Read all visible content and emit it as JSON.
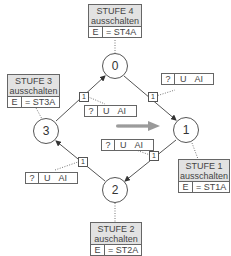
{
  "states": [
    {
      "id": "0",
      "label": "0"
    },
    {
      "id": "1",
      "label": "1"
    },
    {
      "id": "2",
      "label": "2"
    },
    {
      "id": "3",
      "label": "3"
    }
  ],
  "actions": {
    "stufe4": {
      "title": "STUFE 4",
      "subtitle": "ausschalten",
      "e": "E",
      "value": "= ST4A"
    },
    "stufe3": {
      "title": "STUFE 3",
      "subtitle": "ausschalten",
      "e": "E",
      "value": "= ST3A"
    },
    "stufe1": {
      "title": "STUFE 1",
      "subtitle": "ausschalten",
      "e": "E",
      "value": "= ST1A"
    },
    "stufe2": {
      "title": "STUFE 2",
      "subtitle": "auschalten",
      "e": "E",
      "value": "= ST2A"
    }
  },
  "transitions": [
    {
      "from": "0",
      "to": "1",
      "priority": "1",
      "cond": {
        "q": "?",
        "u": "U",
        "a": "AI"
      }
    },
    {
      "from": "1",
      "to": "2",
      "priority": "1",
      "cond": {
        "q": "?",
        "u": "U",
        "a": "AI"
      }
    },
    {
      "from": "2",
      "to": "3",
      "priority": "1",
      "cond": {
        "q": "?",
        "u": "U",
        "a": "AI"
      }
    },
    {
      "from": "3",
      "to": "0",
      "priority": "1",
      "cond": {
        "q": "?",
        "u": "U",
        "a": "AI"
      }
    }
  ],
  "colors": {
    "line": "#555555",
    "header": "#e2e2e2",
    "arrow": "#999999"
  }
}
